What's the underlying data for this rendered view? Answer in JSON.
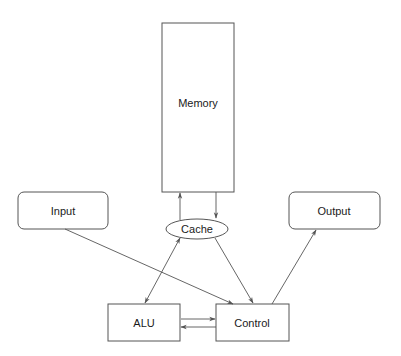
{
  "diagram": {
    "nodes": {
      "memory": {
        "label": "Memory",
        "shape": "rectangle"
      },
      "cache": {
        "label": "Cache",
        "shape": "ellipse"
      },
      "input": {
        "label": "Input",
        "shape": "rounded-rectangle"
      },
      "output": {
        "label": "Output",
        "shape": "rounded-rectangle"
      },
      "alu": {
        "label": "ALU",
        "shape": "rectangle"
      },
      "control": {
        "label": "Control",
        "shape": "rectangle"
      }
    },
    "edges": [
      {
        "from": "cache",
        "to": "memory",
        "direction": "one-way"
      },
      {
        "from": "memory",
        "to": "cache",
        "direction": "one-way"
      },
      {
        "from": "cache",
        "to": "alu",
        "direction": "bidirectional"
      },
      {
        "from": "cache",
        "to": "control",
        "direction": "one-way"
      },
      {
        "from": "input",
        "to": "control",
        "direction": "one-way"
      },
      {
        "from": "control",
        "to": "output",
        "direction": "one-way"
      },
      {
        "from": "alu",
        "to": "control",
        "direction": "one-way"
      },
      {
        "from": "control",
        "to": "alu",
        "direction": "one-way"
      }
    ],
    "colors": {
      "stroke": "#555555",
      "text": "#1a1a1a",
      "background": "#ffffff"
    }
  }
}
